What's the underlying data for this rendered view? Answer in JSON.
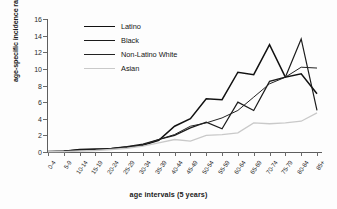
{
  "chart_data": {
    "type": "line",
    "title": "",
    "xlabel": "age intervals (5 years)",
    "ylabel": "age-specific incidence rate",
    "categories": [
      "0-4",
      "5-9",
      "10-14",
      "15-19",
      "20-24",
      "25-29",
      "30-34",
      "35-39",
      "40-44",
      "45-49",
      "50-54",
      "55-59",
      "60-64",
      "65-69",
      "70-74",
      "75-79",
      "80-84",
      "85+"
    ],
    "ylim": [
      0,
      16
    ],
    "yticks": [
      0,
      2,
      4,
      6,
      8,
      10,
      12,
      14,
      16
    ],
    "grid": false,
    "legend_position": "upper-left-inside",
    "series": [
      {
        "name": "Latino",
        "color": "#111111",
        "values": [
          0.05,
          0.1,
          0.3,
          0.35,
          0.4,
          0.6,
          0.8,
          1.4,
          3.1,
          4.0,
          6.4,
          6.3,
          9.6,
          9.3,
          12.9,
          9.0,
          9.4,
          7.0
        ]
      },
      {
        "name": "Black",
        "color": "#1b1b1b",
        "values": [
          0.05,
          0.1,
          0.25,
          0.3,
          0.45,
          0.65,
          0.95,
          1.5,
          2.0,
          2.9,
          3.6,
          2.8,
          6.0,
          5.0,
          8.5,
          9.0,
          13.6,
          5.0
        ]
      },
      {
        "name": "Non-Latino White",
        "color": "#222222",
        "values": [
          0.05,
          0.08,
          0.2,
          0.25,
          0.4,
          0.55,
          0.85,
          1.5,
          2.1,
          3.1,
          3.5,
          4.1,
          5.0,
          6.6,
          8.2,
          9.0,
          10.2,
          10.1
        ]
      },
      {
        "name": "Asian",
        "color": "#c9c9c9",
        "values": [
          0.03,
          0.05,
          0.12,
          0.18,
          0.3,
          0.45,
          0.7,
          1.1,
          1.5,
          1.3,
          2.0,
          2.1,
          2.3,
          3.5,
          3.4,
          3.5,
          3.7,
          4.7
        ]
      }
    ]
  },
  "legend": {
    "items": [
      {
        "label": "Latino"
      },
      {
        "label": "Black"
      },
      {
        "label": "Non-Latino White"
      },
      {
        "label": "Asian"
      }
    ]
  },
  "axis": {
    "y_title": "age-specific incidence rate",
    "x_title": "age intervals (5 years)"
  }
}
